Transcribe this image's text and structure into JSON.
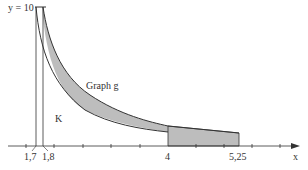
{
  "diagram": {
    "y_label": "y = 10",
    "curve_label": "Graph g",
    "region_label": "K",
    "x_axis_label": "x",
    "x_tick_labels": [
      "1,7",
      "1,8",
      "4",
      "5,25"
    ],
    "fill_color": "#bdbdbd",
    "line_color": "#333333"
  }
}
